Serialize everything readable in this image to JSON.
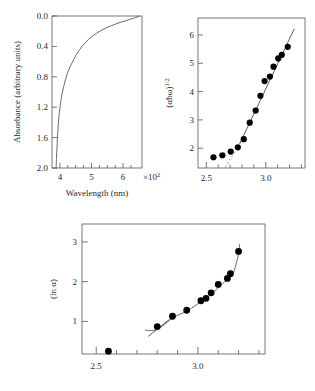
{
  "figure": {
    "panel_count": 3
  },
  "chart_data": [
    {
      "id": "absorbance-spectrum",
      "type": "line",
      "title": "",
      "xlabel": "Wavelength (nm)",
      "ylabel": "Absorbance (arbitrary units)",
      "x_exponent_label": "×10",
      "x_exponent_sup": "2",
      "xlim": [
        3.75,
        6.6
      ],
      "ylim": [
        2.0,
        0.0
      ],
      "y_inverted": true,
      "xticks": [
        4,
        5,
        6
      ],
      "xticklabels": [
        "4",
        "5",
        "6"
      ],
      "xminorticks": [
        4.25,
        4.5,
        4.75,
        5.25,
        5.5,
        5.75,
        6.25
      ],
      "yticks": [
        0.0,
        0.4,
        0.8,
        1.2,
        1.6,
        2.0
      ],
      "yticklabels": [
        "0.0",
        "0.4",
        "0.8",
        "1.2",
        "1.6",
        "2.0"
      ],
      "grid": false,
      "legend": false,
      "series": [
        {
          "name": "absorbance",
          "x": [
            3.88,
            3.9,
            3.93,
            3.97,
            4.02,
            4.08,
            4.15,
            4.25,
            4.38,
            4.52,
            4.7,
            4.9,
            5.15,
            5.45,
            5.8,
            6.1,
            6.4,
            6.52
          ],
          "y": [
            2.0,
            1.8,
            1.55,
            1.32,
            1.15,
            1.0,
            0.88,
            0.74,
            0.62,
            0.51,
            0.4,
            0.31,
            0.23,
            0.16,
            0.1,
            0.06,
            0.02,
            0.0
          ]
        }
      ]
    },
    {
      "id": "tauc-plot",
      "type": "scatter",
      "title": "",
      "xlabel": "",
      "ylabel": "(αħω)",
      "ylabel_sup": "1/2",
      "xlim": [
        2.43,
        3.33
      ],
      "ylim": [
        1.3,
        6.6
      ],
      "xticks": [
        2.5,
        3.0
      ],
      "xticklabels": [
        "2.5",
        "3.0"
      ],
      "xminorticks": [
        2.6,
        2.7,
        2.8,
        2.9,
        3.1,
        3.2,
        3.3
      ],
      "yticks": [
        2,
        3,
        4,
        5,
        6
      ],
      "yticklabels": [
        "2",
        "3",
        "4",
        "5",
        "6"
      ],
      "grid": false,
      "legend": false,
      "series": [
        {
          "name": "(alpha*hbar*omega)^1/2 data",
          "x": [
            2.56,
            2.635,
            2.705,
            2.765,
            2.815,
            2.865,
            2.915,
            2.955,
            2.99,
            3.035,
            3.065,
            3.105,
            3.135,
            3.185
          ],
          "y": [
            1.68,
            1.75,
            1.88,
            2.03,
            2.32,
            2.9,
            3.33,
            3.85,
            4.37,
            4.53,
            4.88,
            5.17,
            5.3,
            5.58
          ]
        }
      ],
      "fit_line": {
        "x": [
          2.78,
          3.24
        ],
        "y": [
          2.15,
          6.22
        ]
      },
      "extrapolation_dashed": {
        "x": [
          2.66,
          2.8
        ],
        "y": [
          1.33,
          2.3
        ]
      }
    },
    {
      "id": "urbach-plot",
      "type": "scatter",
      "title": "",
      "xlabel": "",
      "ylabel": "(ln α)",
      "xlim": [
        2.43,
        3.33
      ],
      "ylim": [
        0.18,
        3.45
      ],
      "xticks": [
        2.5,
        3.0
      ],
      "xticklabels": [
        "2.5",
        "3.0"
      ],
      "xminorticks": [
        2.6,
        2.7,
        2.8,
        2.9,
        3.1,
        3.2,
        3.3
      ],
      "yticks": [
        1,
        2,
        3
      ],
      "yticklabels": [
        "1",
        "2",
        "3"
      ],
      "grid": false,
      "legend": false,
      "series": [
        {
          "name": "(ln alpha) data",
          "x": [
            2.56,
            2.8,
            2.875,
            2.945,
            3.015,
            3.04,
            3.065,
            3.1,
            3.145,
            3.16,
            3.2
          ],
          "y": [
            0.25,
            0.87,
            1.13,
            1.28,
            1.52,
            1.58,
            1.72,
            1.93,
            2.08,
            2.2,
            2.76
          ]
        }
      ],
      "curve_fit": {
        "x": [
          2.74,
          2.8,
          2.88,
          2.95,
          3.02,
          3.07,
          3.11,
          3.15,
          3.175,
          3.2,
          3.205
        ],
        "y": [
          0.78,
          0.8,
          1.1,
          1.27,
          1.52,
          1.7,
          1.9,
          2.08,
          2.22,
          2.7,
          2.95
        ]
      },
      "tangent_segment": {
        "x": [
          2.755,
          2.86
        ],
        "y": [
          0.62,
          1.05
        ]
      }
    }
  ]
}
